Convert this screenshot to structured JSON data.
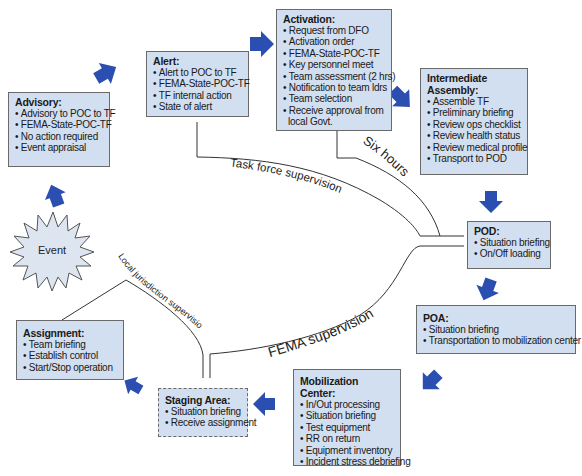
{
  "event": {
    "label": "Event"
  },
  "boxes": {
    "advisory": {
      "title": "Advisory:",
      "items": [
        "Advisory to POC to TF",
        "FEMA-State-POC-TF",
        "No action required",
        "Event appraisal"
      ]
    },
    "alert": {
      "title": "Alert:",
      "items": [
        "Alert to POC to TF",
        "FEMA-State-POC-TF",
        "TF internal action",
        "State of alert"
      ]
    },
    "activation": {
      "title": "Activation:",
      "items": [
        "Request from DFO",
        "Activation order",
        "FEMA-State-POC-TF",
        "Key personnel meet",
        "Team assessment (2 hrs)",
        "Notification to team ldrs",
        "Team selection",
        "Receive approval from"
      ],
      "continuation": "local Govt."
    },
    "intermediate_assembly": {
      "title_line1": "Intermediate",
      "title_line2": "Assembly:",
      "items": [
        "Assemble TF",
        "Preliminary briefing",
        "Review ops checklist",
        "Review health status",
        "Review medical profile",
        "Transport to POD"
      ]
    },
    "pod": {
      "title": "POD:",
      "items": [
        "Situation briefing",
        "On/Off loading"
      ]
    },
    "poa": {
      "title": "POA:",
      "items": [
        "Situation briefing",
        "Transportation to mobilization center"
      ]
    },
    "mobilization_center": {
      "title": "Mobilization Center:",
      "items": [
        "In/Out processing",
        "Situation briefing",
        "Test equipment",
        "RR on return",
        "Equipment inventory",
        "Incident stress debriefing"
      ]
    },
    "staging_area": {
      "title": "Staging Area:",
      "items": [
        "Situation briefing",
        "Receive assignment"
      ]
    },
    "assignment": {
      "title": "Assignment:",
      "items": [
        "Team briefing",
        "Establish control",
        "Start/Stop operation"
      ]
    }
  },
  "curve_labels": {
    "task_force": "Task force supervision",
    "six_hours": "Six hours",
    "fema": "FEMA supervision",
    "local": "Local jurisdiction supervision"
  },
  "colors": {
    "arrow": "#2b4fb0",
    "box_fill": "#d2dff0",
    "box_border": "#6a6a6a",
    "starburst_fill": "#dde6f0",
    "line": "#333333"
  }
}
